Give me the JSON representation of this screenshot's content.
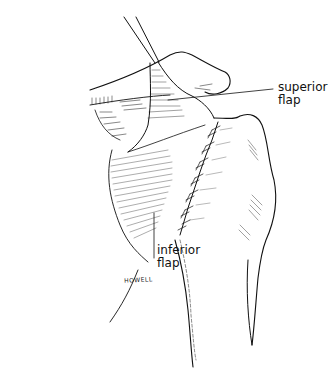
{
  "figure": {
    "labels": {
      "superior": {
        "line1": "superior",
        "line2": "flap"
      },
      "inferior": {
        "line1": "inferior",
        "line2": "flap"
      }
    },
    "signature": "HOWELL",
    "colors": {
      "ink": "#111111",
      "background": "#ffffff"
    }
  }
}
